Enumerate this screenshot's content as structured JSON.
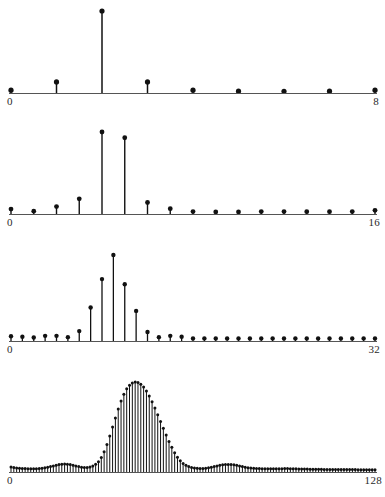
{
  "figure": {
    "title": "",
    "background_color": "#ffffff",
    "ink_color": "#111111",
    "width": 385,
    "height": 497,
    "panel_count": 4
  },
  "chart_data": [
    {
      "type": "bar",
      "panel_index": 0,
      "title": "8-point DFT magnitude",
      "xlabel": "",
      "ylabel": "",
      "grid": false,
      "legend_position": "none",
      "axis_start_label": "0",
      "axis_end_label": "8",
      "xlim": [
        0,
        8
      ],
      "ylim": [
        0,
        1.0
      ],
      "marker": "filled-circle",
      "x": [
        0,
        1,
        2,
        3,
        4,
        5,
        6,
        7,
        8
      ],
      "categories": [
        "0",
        "1",
        "2",
        "3",
        "4",
        "5",
        "6",
        "7",
        "8"
      ],
      "values": [
        0.035,
        0.135,
        1.0,
        0.135,
        0.035,
        0.022,
        0.02,
        0.022,
        0.035
      ]
    },
    {
      "type": "bar",
      "panel_index": 1,
      "title": "16-point DFT magnitude",
      "xlabel": "",
      "ylabel": "",
      "grid": false,
      "legend_position": "none",
      "axis_start_label": "0",
      "axis_end_label": "16",
      "xlim": [
        0,
        16
      ],
      "ylim": [
        0,
        1.0
      ],
      "marker": "filled-circle",
      "x": [
        0,
        1,
        2,
        3,
        4,
        5,
        6,
        7,
        8,
        9,
        10,
        11,
        12,
        13,
        14,
        15,
        16
      ],
      "categories": [
        "0",
        "1",
        "2",
        "3",
        "4",
        "5",
        "6",
        "7",
        "8",
        "9",
        "10",
        "11",
        "12",
        "13",
        "14",
        "15",
        "16"
      ],
      "values": [
        0.06,
        0.035,
        0.09,
        0.185,
        1.0,
        0.93,
        0.14,
        0.065,
        0.03,
        0.025,
        0.025,
        0.03,
        0.03,
        0.028,
        0.028,
        0.03,
        0.045
      ]
    },
    {
      "type": "bar",
      "panel_index": 2,
      "title": "32-point DFT magnitude",
      "xlabel": "",
      "ylabel": "",
      "grid": false,
      "legend_position": "none",
      "axis_start_label": "0",
      "axis_end_label": "32",
      "xlim": [
        0,
        32
      ],
      "ylim": [
        0,
        1.0
      ],
      "marker": "filled-circle",
      "x": [
        0,
        1,
        2,
        3,
        4,
        5,
        6,
        7,
        8,
        9,
        10,
        11,
        12,
        13,
        14,
        15,
        16,
        17,
        18,
        19,
        20,
        21,
        22,
        23,
        24,
        25,
        26,
        27,
        28,
        29,
        30,
        31,
        32
      ],
      "categories": [
        "0",
        "1",
        "2",
        "3",
        "4",
        "5",
        "6",
        "7",
        "8",
        "9",
        "10",
        "11",
        "12",
        "13",
        "14",
        "15",
        "16",
        "17",
        "18",
        "19",
        "20",
        "21",
        "22",
        "23",
        "24",
        "25",
        "26",
        "27",
        "28",
        "29",
        "30",
        "31",
        "32"
      ],
      "values": [
        0.055,
        0.05,
        0.04,
        0.06,
        0.06,
        0.045,
        0.115,
        0.39,
        0.72,
        1.0,
        0.66,
        0.35,
        0.105,
        0.045,
        0.06,
        0.05,
        0.03,
        0.03,
        0.03,
        0.03,
        0.03,
        0.03,
        0.03,
        0.03,
        0.03,
        0.03,
        0.03,
        0.03,
        0.03,
        0.03,
        0.03,
        0.03,
        0.03
      ]
    },
    {
      "type": "bar",
      "panel_index": 3,
      "title": "128-point DFT magnitude",
      "xlabel": "",
      "ylabel": "",
      "grid": false,
      "legend_position": "none",
      "axis_start_label": "0",
      "axis_end_label": "128",
      "xlim": [
        0,
        128
      ],
      "ylim": [
        0,
        1.0
      ],
      "marker": "filled-circle",
      "x_count": 129,
      "values": [
        0.055,
        0.05,
        0.045,
        0.042,
        0.04,
        0.038,
        0.037,
        0.036,
        0.036,
        0.037,
        0.039,
        0.042,
        0.046,
        0.052,
        0.06,
        0.068,
        0.076,
        0.082,
        0.086,
        0.088,
        0.086,
        0.082,
        0.076,
        0.068,
        0.06,
        0.054,
        0.05,
        0.05,
        0.055,
        0.066,
        0.085,
        0.115,
        0.16,
        0.225,
        0.305,
        0.4,
        0.5,
        0.6,
        0.7,
        0.79,
        0.865,
        0.925,
        0.965,
        0.99,
        1.0,
        0.995,
        0.975,
        0.945,
        0.9,
        0.845,
        0.78,
        0.71,
        0.635,
        0.56,
        0.485,
        0.41,
        0.34,
        0.275,
        0.215,
        0.165,
        0.125,
        0.095,
        0.075,
        0.06,
        0.05,
        0.045,
        0.042,
        0.04,
        0.04,
        0.042,
        0.046,
        0.052,
        0.06,
        0.068,
        0.075,
        0.08,
        0.083,
        0.084,
        0.083,
        0.08,
        0.075,
        0.068,
        0.06,
        0.053,
        0.048,
        0.044,
        0.041,
        0.039,
        0.038,
        0.037,
        0.036,
        0.036,
        0.035,
        0.035,
        0.035,
        0.036,
        0.037,
        0.038,
        0.038,
        0.037,
        0.036,
        0.035,
        0.034,
        0.033,
        0.032,
        0.032,
        0.031,
        0.031,
        0.03,
        0.03,
        0.03,
        0.029,
        0.029,
        0.029,
        0.028,
        0.028,
        0.028,
        0.028,
        0.027,
        0.027,
        0.027,
        0.027,
        0.027,
        0.026,
        0.026,
        0.026,
        0.026,
        0.026,
        0.026,
        0.026
      ]
    }
  ]
}
